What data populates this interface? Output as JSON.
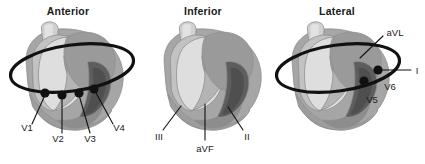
{
  "figure": {
    "kind": "diagram",
    "background_color": "#ffffff",
    "ink_color": "#111111"
  },
  "palette": {
    "vessel_light": "#d8d8d8",
    "left_atrium": "#b9b9b9",
    "right_atrium_dome": "#9a9a9a",
    "left_ventricle_light": "#dcdcdc",
    "mid_gray": "#b0b0b0",
    "right_ventricle_dark": "#5e5e5e",
    "body_gray": "#a6a6a6",
    "outline_gray": "#8f8f8f",
    "deep_shadow": "#6f6f6f"
  },
  "panels": [
    {
      "id": "anterior",
      "title": "Anterior",
      "title_x": 68,
      "title_y": 15,
      "has_ring": true,
      "ring": {
        "cx": 72,
        "cy": 68,
        "rx": 62,
        "ry": 23,
        "rotate": -8
      },
      "leads": [
        {
          "label": "V1",
          "dot_x": 45,
          "dot_y": 93,
          "label_x": 27,
          "label_y": 131,
          "leader": "M45,95 L32,124"
        },
        {
          "label": "V2",
          "dot_x": 62,
          "dot_y": 95,
          "label_x": 58,
          "label_y": 140,
          "leader": "M62,97 L62,133"
        },
        {
          "label": "V3",
          "dot_x": 79,
          "dot_y": 93,
          "label_x": 87,
          "label_y": 140,
          "leader": "M79,95 L90,133"
        },
        {
          "label": "V4",
          "dot_x": 94,
          "dot_y": 89,
          "label_x": 114,
          "label_y": 131,
          "leader": "M95,91 L113,124"
        }
      ]
    },
    {
      "id": "inferior",
      "title": "Inferior",
      "title_x": 203,
      "title_y": 15,
      "has_ring": false,
      "ring": null,
      "leads": [
        {
          "label": "III",
          "dot_x": null,
          "dot_y": null,
          "label_x": 159,
          "label_y": 138,
          "leader": "M181,106 L164,129"
        },
        {
          "label": "aVF",
          "dot_x": null,
          "dot_y": null,
          "label_x": 196,
          "label_y": 150,
          "leader": "M205,105 L205,140"
        },
        {
          "label": "II",
          "dot_x": null,
          "dot_y": null,
          "label_x": 243,
          "label_y": 138,
          "leader": "M228,108 L242,129"
        }
      ]
    },
    {
      "id": "lateral",
      "title": "Lateral",
      "title_x": 337,
      "title_y": 15,
      "has_ring": true,
      "ring": {
        "cx": 338,
        "cy": 68,
        "rx": 62,
        "ry": 23,
        "rotate": -8
      },
      "leads": [
        {
          "label": "aVL",
          "dot_x": null,
          "dot_y": null,
          "label_x": 386,
          "label_y": 33,
          "leader": "M362,60 L385,38"
        },
        {
          "label": "I",
          "dot_x": 378,
          "dot_y": 70,
          "label_x": 416,
          "label_y": 74,
          "leader": "M378,70 L412,70"
        },
        {
          "label": "V6",
          "dot_x": 378,
          "dot_y": 70,
          "label_x": 385,
          "label_y": 88,
          "leader": null
        },
        {
          "label": "V5",
          "dot_x": 364,
          "dot_y": 81,
          "label_x": 372,
          "label_y": 101,
          "leader": null
        }
      ]
    }
  ]
}
